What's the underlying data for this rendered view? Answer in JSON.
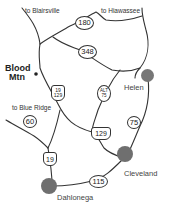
{
  "map": {
    "colors": {
      "road": "#333333",
      "town_dot": "#777777",
      "background": "#ffffff"
    },
    "direction_labels": [
      {
        "text": "to Blairsville"
      },
      {
        "text": "to Hiawassee"
      },
      {
        "text": "to Blue Ridge"
      }
    ],
    "landmark": {
      "line1": "Blood",
      "line2": "Mtn"
    },
    "towns": [
      {
        "name": "Helen"
      },
      {
        "name": "Cleveland"
      },
      {
        "name": "Dahlonega"
      }
    ],
    "route_shields": [
      {
        "label": "180"
      },
      {
        "label": "348"
      },
      {
        "label_top": "19",
        "label_bottom": "129"
      },
      {
        "label_top": "ALT",
        "label_bottom": "75"
      },
      {
        "label": "60"
      },
      {
        "label": "75"
      },
      {
        "label": "129"
      },
      {
        "label": "19"
      },
      {
        "label": "115"
      }
    ]
  }
}
